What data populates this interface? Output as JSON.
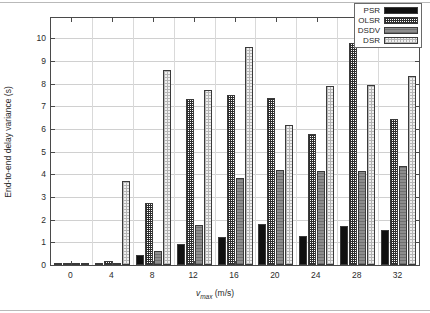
{
  "chart_data": {
    "type": "bar",
    "title": "",
    "xlabel": "v_max (m/s)",
    "xlabel_main": "v",
    "xlabel_sub": "max",
    "xlabel_unit": " (m/s)",
    "ylabel": "End-to-end delay variance (s)",
    "categories": [
      "0",
      "4",
      "8",
      "12",
      "16",
      "20",
      "24",
      "28",
      "32"
    ],
    "xtick_labels": [
      "0",
      "4",
      "8",
      "12",
      "16",
      "20",
      "24",
      "28",
      "32"
    ],
    "ytick_labels": [
      "0",
      "1",
      "2",
      "3",
      "4",
      "5",
      "6",
      "7",
      "8",
      "9",
      "10"
    ],
    "ylim": [
      0,
      10.9
    ],
    "ytick_values": [
      0,
      1,
      2,
      3,
      4,
      5,
      6,
      7,
      8,
      9,
      10
    ],
    "grid": true,
    "grid_axis": "y",
    "legend_position": "top-right",
    "series": [
      {
        "name": "PSR",
        "key": "psr",
        "color": "#101010",
        "pattern": "solid-black",
        "values": [
          0.02,
          0.03,
          0.42,
          0.92,
          1.24,
          1.8,
          1.28,
          1.72,
          1.55
        ]
      },
      {
        "name": "OLSR",
        "key": "olsr",
        "color": "#2e2e2e",
        "pattern": "dense-checker",
        "values": [
          0.05,
          0.18,
          2.72,
          7.33,
          7.52,
          7.38,
          5.76,
          9.78,
          6.45
        ]
      },
      {
        "name": "DSDV",
        "key": "dsdv",
        "color": "#8d8d8d",
        "pattern": "solid-grey-lines",
        "values": [
          0.06,
          0.06,
          0.64,
          1.75,
          3.84,
          4.18,
          4.13,
          4.14,
          4.35
        ]
      },
      {
        "name": "DSR",
        "key": "dsr",
        "color": "#f0f0f0",
        "pattern": "light-dots",
        "values": [
          0.03,
          3.7,
          8.62,
          7.73,
          9.64,
          6.18,
          7.92,
          7.95,
          8.32
        ]
      }
    ]
  }
}
